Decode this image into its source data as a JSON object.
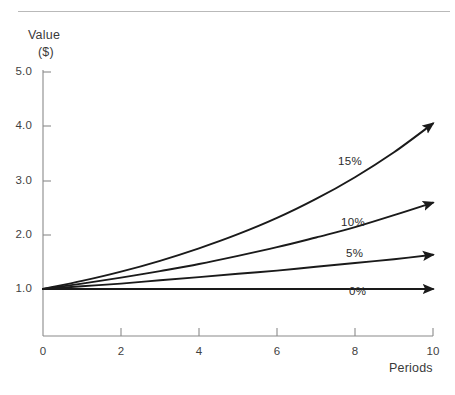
{
  "chart_data": {
    "type": "line",
    "title": "",
    "subtitle": "",
    "xlabel": "Periods",
    "ylabel": "Value ($)",
    "ylabel_lines": [
      "Value",
      "($)"
    ],
    "xlim": [
      0,
      10
    ],
    "ylim": [
      1.0,
      5.0
    ],
    "grid": false,
    "legend_position": "inline-annotations",
    "x_ticks": [
      {
        "value": 0,
        "label": "0"
      },
      {
        "value": 2,
        "label": "2"
      },
      {
        "value": 4,
        "label": "4"
      },
      {
        "value": 6,
        "label": "6"
      },
      {
        "value": 8,
        "label": "8"
      },
      {
        "value": 10,
        "label": "10"
      }
    ],
    "y_ticks": [
      {
        "value": 5.0,
        "label": "5.0"
      },
      {
        "value": 4.0,
        "label": "4.0"
      },
      {
        "value": 3.0,
        "label": "3.0"
      },
      {
        "value": 2.0,
        "label": "2.0"
      },
      {
        "value": 1.0,
        "label": "1.0"
      }
    ],
    "x": [
      0,
      1,
      2,
      3,
      4,
      5,
      6,
      7,
      8,
      9,
      10
    ],
    "series": [
      {
        "name": "15%",
        "rate": 0.15,
        "annotation": "15%",
        "arrow_end": true,
        "values": [
          1.0,
          1.15,
          1.32,
          1.52,
          1.75,
          2.01,
          2.31,
          2.66,
          3.06,
          3.52,
          4.05
        ]
      },
      {
        "name": "10%",
        "rate": 0.1,
        "annotation": "10%",
        "arrow_end": true,
        "values": [
          1.0,
          1.1,
          1.21,
          1.33,
          1.46,
          1.61,
          1.77,
          1.95,
          2.14,
          2.36,
          2.59
        ]
      },
      {
        "name": "5%",
        "rate": 0.05,
        "annotation": "5%",
        "arrow_end": true,
        "values": [
          1.0,
          1.05,
          1.1,
          1.16,
          1.22,
          1.28,
          1.34,
          1.41,
          1.48,
          1.55,
          1.63
        ]
      },
      {
        "name": "0%",
        "rate": 0.0,
        "annotation": "0%",
        "arrow_end": true,
        "values": [
          1.0,
          1.0,
          1.0,
          1.0,
          1.0,
          1.0,
          1.0,
          1.0,
          1.0,
          1.0,
          1.0
        ]
      }
    ],
    "annotations": [
      {
        "text": "15%",
        "x_px": 338,
        "y_px": 155
      },
      {
        "text": "10%",
        "x_px": 341,
        "y_px": 216
      },
      {
        "text": "5%",
        "x_px": 346,
        "y_px": 247
      },
      {
        "text": "0%",
        "x_px": 349,
        "y_px": 285
      }
    ],
    "colors": {
      "curve": "#1a1a1a",
      "axis": "#8a8a8a",
      "text": "#2b2b2b",
      "rule": "#b9b9b9",
      "background": "#ffffff"
    }
  }
}
